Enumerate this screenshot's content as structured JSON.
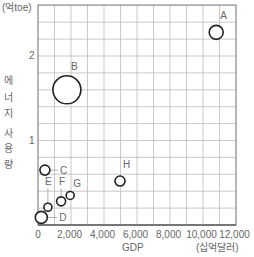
{
  "chart_data": {
    "type": "scatter",
    "title": "",
    "xlabel": "GDP",
    "x_unit": "(십억달러)",
    "ylabel": "에너지 사용량",
    "y_unit": "(억toe)",
    "xlim": [
      0,
      12000
    ],
    "ylim": [
      0,
      2.5
    ],
    "x_ticks": [
      0,
      2000,
      4000,
      6000,
      8000,
      10000,
      12000
    ],
    "x_tick_labels": [
      "0",
      "2,000",
      "4,000",
      "6,000",
      "8,000",
      "10,000",
      "12,000"
    ],
    "y_ticks": [
      1,
      2
    ],
    "y_tick_labels": [
      "1",
      "2"
    ],
    "grid": true,
    "grid_x_step": 1000,
    "grid_y_step": 0.2,
    "legend": null,
    "points": [
      {
        "label": "A",
        "x": 10800,
        "y": 2.28,
        "size": 7
      },
      {
        "label": "B",
        "x": 1750,
        "y": 1.6,
        "size": 14
      },
      {
        "label": "C",
        "x": 420,
        "y": 0.65,
        "size": 5
      },
      {
        "label": "D",
        "x": 200,
        "y": 0.09,
        "size": 6
      },
      {
        "label": "E",
        "x": 600,
        "y": 0.21,
        "size": 4
      },
      {
        "label": "F",
        "x": 1400,
        "y": 0.28,
        "size": 4.5
      },
      {
        "label": "G",
        "x": 1950,
        "y": 0.35,
        "size": 4
      },
      {
        "label": "H",
        "x": 4970,
        "y": 0.52,
        "size": 5
      }
    ]
  },
  "labels": {
    "y_unit": "(억toe)",
    "x_title": "GDP",
    "x_unit": "(십억달러)",
    "y_title_chars": [
      "에",
      "너",
      "지",
      "사",
      "용",
      "량"
    ]
  },
  "colors": {
    "grid": "#bbbbbb",
    "axis": "#888888",
    "marker": "#222222",
    "text": "#666666"
  }
}
